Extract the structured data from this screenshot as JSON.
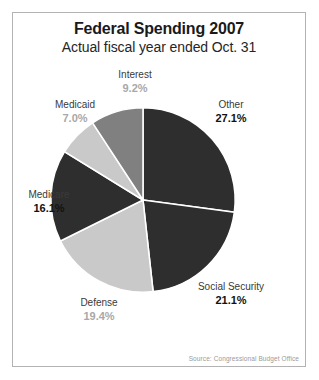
{
  "chart_data": {
    "type": "pie",
    "title": "Federal Spending 2007",
    "subtitle": "Actual fiscal year ended Oct. 31",
    "source": "Source: Congressional Budget Office",
    "xlabel": "",
    "ylabel": "",
    "legend_position": "none",
    "grid": false,
    "start_angle_deg": 0,
    "direction": "clockwise",
    "categories": [
      "Other",
      "Social Security",
      "Defense",
      "Medicare",
      "Medicaid",
      "Interest"
    ],
    "values": [
      27.1,
      21.1,
      19.4,
      16.1,
      7.0,
      9.2
    ],
    "slices": [
      {
        "label": "Other",
        "value": 27.1,
        "percent_text": "27.1%",
        "color": "#2e2e2e",
        "label_tone": "dark"
      },
      {
        "label": "Social Security",
        "value": 21.1,
        "percent_text": "21.1%",
        "color": "#2e2e2e",
        "label_tone": "dark"
      },
      {
        "label": "Defense",
        "value": 19.4,
        "percent_text": "19.4%",
        "color": "#c9c9c9",
        "label_tone": "light"
      },
      {
        "label": "Medicare",
        "value": 16.1,
        "percent_text": "16.1%",
        "color": "#2e2e2e",
        "label_tone": "dark"
      },
      {
        "label": "Medicaid",
        "value": 7.0,
        "percent_text": "7.0%",
        "color": "#c9c9c9",
        "label_tone": "light"
      },
      {
        "label": "Interest",
        "value": 9.2,
        "percent_text": "9.2%",
        "color": "#808080",
        "label_tone": "light"
      }
    ],
    "colors": {
      "dark_slice": "#2e2e2e",
      "light_slice": "#c9c9c9",
      "medium_slice": "#808080",
      "separator": "#ffffff",
      "frame_border": "#b3b3b3",
      "title_text": "#1a1a1a",
      "source_text": "#9a9a9a"
    }
  }
}
